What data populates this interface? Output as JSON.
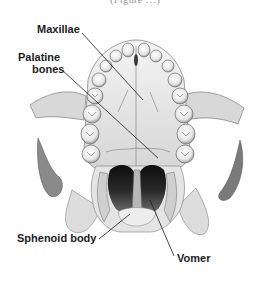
{
  "figure": {
    "caption_partial": "(Figure …)",
    "labels": [
      {
        "id": "maxillae",
        "text": "Maxillae"
      },
      {
        "id": "palatine-line1",
        "text": "Palatine"
      },
      {
        "id": "palatine-line2",
        "text": "bones"
      },
      {
        "id": "sphenoid",
        "text": "Sphenoid body"
      },
      {
        "id": "vomer",
        "text": "Vomer"
      }
    ],
    "colors": {
      "ink": "#1c1c1c",
      "shade_dark": "#1a1a1a",
      "shade_mid": "#6e6e6e",
      "shade_light": "#c9c9c9",
      "background": "#ffffff"
    }
  }
}
